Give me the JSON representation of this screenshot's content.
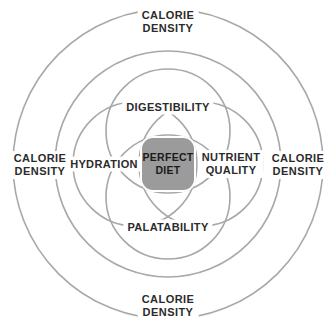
{
  "diagram": {
    "colors": {
      "stroke": "#a8a8a8",
      "core_fill": "#9b9b9b",
      "text": "#2b2b2b",
      "background": "#ffffff"
    },
    "center": {
      "name": "perfect-diet",
      "line1": "PERFECT",
      "line2": "DIET"
    },
    "inner_labels": [
      {
        "name": "digestibility",
        "line1": "DIGESTIBILITY",
        "line2": "",
        "x": 168,
        "y": 107
      },
      {
        "name": "nutrient-quality",
        "line1": "NUTRIENT",
        "line2": "QUALITY",
        "x": 231,
        "y": 164
      },
      {
        "name": "palatability",
        "line1": "PALATABILITY",
        "line2": "",
        "x": 168,
        "y": 227
      },
      {
        "name": "hydration",
        "line1": "HYDRATION",
        "line2": "",
        "x": 104,
        "y": 164
      }
    ],
    "outer_labels": [
      {
        "name": "calorie-density-top",
        "line1": "CALORIE",
        "line2": "DENSITY",
        "x": 168,
        "y": 22
      },
      {
        "name": "calorie-density-right",
        "line1": "CALORIE",
        "line2": "DENSITY",
        "x": 298,
        "y": 165
      },
      {
        "name": "calorie-density-bottom",
        "line1": "CALORIE",
        "line2": "DENSITY",
        "x": 168,
        "y": 306
      },
      {
        "name": "calorie-density-left",
        "line1": "CALORIE",
        "line2": "DENSITY",
        "x": 40,
        "y": 165
      }
    ],
    "geometry": {
      "cx": 168,
      "cy": 164,
      "outer_ring_r": 155,
      "middle_ring_r": 113,
      "petal_r": 62,
      "petal_offset": 33
    }
  }
}
